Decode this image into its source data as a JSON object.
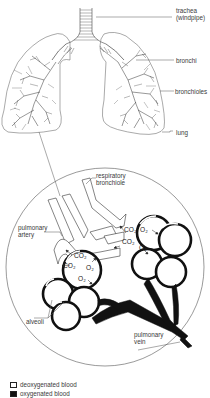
{
  "lung_labels": {
    "trachea": "trachea",
    "trachea_alt": "(windpipe)",
    "bronchi": "bronchi",
    "bronchioles": "bronchioles",
    "lung": "lung"
  },
  "detail_labels": {
    "respiratory_1": "respiratory",
    "respiratory_2": "bronchiole",
    "pulmonary_artery_1": "pulmonary",
    "pulmonary_artery_2": "artery",
    "alveoli": "alveoli",
    "pulmonary_vein_1": "pulmonary",
    "pulmonary_vein_2": "vein"
  },
  "gas_labels": {
    "co2": "CO₂",
    "o2": "O₂"
  },
  "legend": [
    {
      "label": "deoxygenated blood",
      "color": "#ffffff"
    },
    {
      "label": "oxygenated blood",
      "color": "#111111"
    }
  ],
  "colors": {
    "line": "#333333",
    "oxygenated": "#111111",
    "deoxygenated": "#ffffff"
  }
}
